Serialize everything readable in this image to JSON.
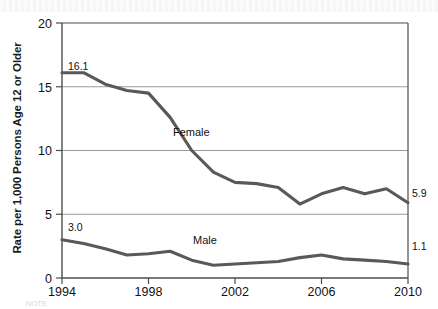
{
  "chart_data": {
    "type": "line",
    "title": "",
    "xlabel": "",
    "ylabel": "Rate per 1,000 Persons Age 12 or Older",
    "x": [
      1994,
      1995,
      1996,
      1997,
      1998,
      1999,
      2000,
      2001,
      2002,
      2003,
      2004,
      2005,
      2006,
      2007,
      2008,
      2009,
      2010
    ],
    "xlim": [
      1994,
      2010
    ],
    "ylim": [
      0,
      20
    ],
    "yticks": [
      "0",
      "5",
      "10",
      "15",
      "20"
    ],
    "xticks": [
      "1994",
      "1998",
      "2002",
      "2006",
      "2010"
    ],
    "grid": "horizontal",
    "legend_position": "inline-annotations",
    "series": [
      {
        "name": "Female",
        "color": "#595959",
        "values": [
          16.1,
          16.1,
          15.2,
          14.7,
          14.5,
          12.6,
          10.0,
          8.3,
          7.5,
          7.4,
          7.1,
          5.8,
          6.6,
          7.1,
          6.6,
          7.0,
          5.9
        ],
        "start_label": "16.1",
        "end_label": "5.9"
      },
      {
        "name": "Male",
        "color": "#595959",
        "values": [
          3.0,
          2.7,
          2.3,
          1.8,
          1.9,
          2.1,
          1.4,
          1.0,
          1.1,
          1.2,
          1.3,
          1.6,
          1.8,
          1.5,
          1.4,
          1.3,
          1.1
        ],
        "start_label": "3.0",
        "end_label": "1.1"
      }
    ],
    "annotations": [
      {
        "text": "16.1",
        "x": 1994,
        "y": 16.1,
        "placement": "above-left"
      },
      {
        "text": "5.9",
        "x": 2010,
        "y": 5.9,
        "placement": "right"
      },
      {
        "text": "3.0",
        "x": 1994,
        "y": 3.0,
        "placement": "above-left"
      },
      {
        "text": "1.1",
        "x": 2010,
        "y": 1.1,
        "placement": "right"
      },
      {
        "text": "Female",
        "x": 2000.5,
        "y": 11.5,
        "placement": "inline"
      },
      {
        "text": "Male",
        "x": 2000.0,
        "y": 2.6,
        "placement": "inline"
      }
    ]
  },
  "axis": {
    "y_title": "Rate per 1,000 Persons Age 12 or Older",
    "y_tick_20": "20",
    "y_tick_15": "15",
    "y_tick_10": "10",
    "y_tick_5": "5",
    "y_tick_0": "0",
    "x_tick_1994": "1994",
    "x_tick_1998": "1998",
    "x_tick_2002": "2002",
    "x_tick_2006": "2006",
    "x_tick_2010": "2010"
  },
  "labels": {
    "female_series": "Female",
    "male_series": "Male",
    "female_start": "16.1",
    "female_end": "5.9",
    "male_start": "3.0",
    "male_end": "1.1"
  },
  "footer": {
    "note": "NOTE:"
  }
}
